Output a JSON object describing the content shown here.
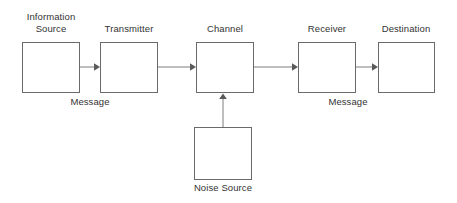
{
  "diagram": {
    "background_color": "#ffffff",
    "box_border_color": "#6a6a6a",
    "text_color": "#333333",
    "arrow_color": "#7d7d7d",
    "nodes": [
      {
        "id": "information-source",
        "label": "Information\nSource",
        "x": 22,
        "y": 42,
        "w": 58,
        "h": 51,
        "label_x": 10,
        "label_y": 11,
        "label_w": 82
      },
      {
        "id": "transmitter",
        "label": "Transmitter",
        "x": 100,
        "y": 42,
        "w": 58,
        "h": 51,
        "label_x": 88,
        "label_y": 23,
        "label_w": 82
      },
      {
        "id": "channel",
        "label": "Channel",
        "x": 196,
        "y": 42,
        "w": 58,
        "h": 51,
        "label_x": 184,
        "label_y": 23,
        "label_w": 82
      },
      {
        "id": "receiver",
        "label": "Receiver",
        "x": 298,
        "y": 42,
        "w": 58,
        "h": 51,
        "label_x": 286,
        "label_y": 23,
        "label_w": 82
      },
      {
        "id": "destination",
        "label": "Destination",
        "x": 378,
        "y": 42,
        "w": 57,
        "h": 51,
        "label_x": 365,
        "label_y": 23,
        "label_w": 82
      },
      {
        "id": "noise-source",
        "label": "Noise Source",
        "x": 194,
        "y": 127,
        "w": 58,
        "h": 53,
        "label_x": 182,
        "label_y": 182,
        "label_w": 82
      }
    ],
    "edge_labels": [
      {
        "id": "message-left",
        "text": "Message",
        "x": 50,
        "y": 96,
        "w": 80
      },
      {
        "id": "message-right",
        "text": "Message",
        "x": 308,
        "y": 96,
        "w": 80
      }
    ],
    "connections": [
      {
        "id": "source-to-transmitter",
        "from": "information-source",
        "to": "transmitter",
        "direction": "right",
        "x1": 80,
        "y1": 67,
        "x2": 99,
        "y2": 67
      },
      {
        "id": "transmitter-to-channel",
        "from": "transmitter",
        "to": "channel",
        "direction": "right",
        "x1": 158,
        "y1": 67,
        "x2": 195,
        "y2": 67
      },
      {
        "id": "channel-to-receiver",
        "from": "channel",
        "to": "receiver",
        "direction": "right",
        "x1": 254,
        "y1": 67,
        "x2": 297,
        "y2": 67
      },
      {
        "id": "receiver-to-destination",
        "from": "receiver",
        "to": "destination",
        "direction": "right",
        "x1": 356,
        "y1": 67,
        "x2": 377,
        "y2": 67
      },
      {
        "id": "noise-to-channel",
        "from": "noise-source",
        "to": "channel",
        "direction": "up",
        "x1": 223,
        "y1": 127,
        "x2": 223,
        "y2": 94
      }
    ]
  }
}
